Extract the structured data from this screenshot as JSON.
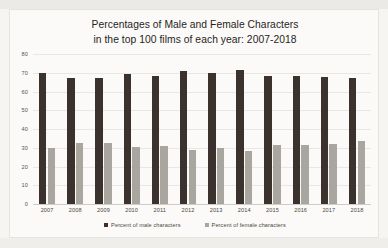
{
  "chart_data": {
    "type": "bar",
    "title": "Percentages of Male and Female Characters in the top 100 films of each year: 2007-2018",
    "title_lines": [
      "Percentages of Male and Female Characters",
      "in the top 100 films of each year: 2007-2018"
    ],
    "categories": [
      "2007",
      "2008",
      "2009",
      "2010",
      "2011",
      "2012",
      "2013",
      "2014",
      "2015",
      "2016",
      "2017",
      "2018"
    ],
    "series": [
      {
        "name": "Percent of male characters",
        "color": "#3b322d",
        "values": [
          70,
          67,
          67,
          69.5,
          68.5,
          71,
          70,
          71.5,
          68.5,
          68.5,
          68,
          67
        ]
      },
      {
        "name": "Percent of female characters",
        "color": "#a9a59f",
        "values": [
          30,
          32.5,
          32.5,
          30.5,
          31,
          29,
          30,
          28.5,
          31.5,
          31.5,
          32,
          33.5
        ]
      }
    ],
    "xlabel": "",
    "ylabel": "",
    "ylim": [
      0,
      80
    ],
    "ytick_step": 10,
    "yticks": [
      "80",
      "70",
      "60",
      "50",
      "40",
      "30",
      "20",
      "10",
      "0"
    ],
    "grid": true,
    "legend_position": "bottom"
  }
}
